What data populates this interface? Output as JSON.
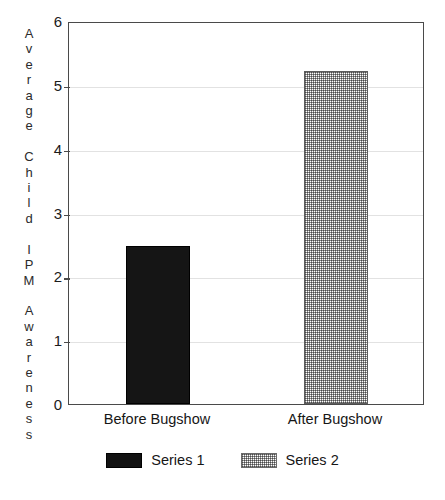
{
  "chart_data": {
    "type": "bar",
    "title": "",
    "subtitle": "",
    "xlabel": "",
    "ylabel": "Average Child IPM Awareness",
    "ylabel_vertical_text": "A\nv\ne\nr\na\ng\ne\n\nC\nh\ni\nl\nd\n\nI\nP\nM\n\nA\nw\na\nr\ne\nn\ne\ns\ns",
    "categories": [
      "Before Bugshow",
      "After Bugshow"
    ],
    "series": [
      {
        "name": "Series 1",
        "values": [
          2.48,
          null
        ],
        "fill": "solid-black",
        "color": "#151515"
      },
      {
        "name": "Series 2",
        "values": [
          null,
          5.22
        ],
        "fill": "checker-hatch",
        "color": "#8a8a8a"
      }
    ],
    "ylim": [
      0,
      6
    ],
    "yticks": [
      0,
      1,
      2,
      3,
      4,
      5,
      6
    ],
    "ytick_labels": [
      "0",
      "1",
      "2",
      "3",
      "4",
      "5",
      "6"
    ],
    "grid": true,
    "grid_axis": "y",
    "grid_color": "#e2e2e2",
    "legend_position": "bottom-center",
    "frame_color": "#4a4a4a",
    "background": "#ffffff"
  },
  "legend": {
    "items": [
      {
        "label": "Series 1",
        "swatch": "solid"
      },
      {
        "label": "Series 2",
        "swatch": "hatch"
      }
    ]
  }
}
